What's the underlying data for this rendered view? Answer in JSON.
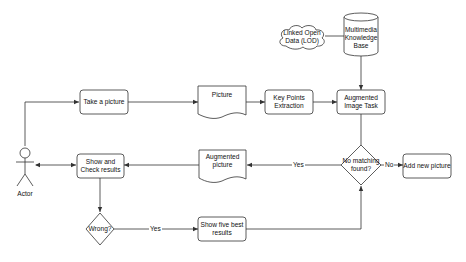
{
  "diagram": {
    "type": "flowchart",
    "nodes": {
      "take_picture": {
        "label": "Take a picture",
        "shape": "rounded-rect"
      },
      "picture": {
        "label": "Picture",
        "shape": "document"
      },
      "key_points": {
        "label": "Key Points Extraction",
        "shape": "rounded-rect"
      },
      "augmented_task": {
        "label": "Augmented Image Task",
        "shape": "rounded-rect"
      },
      "knowledge_base": {
        "label": "Multimedia Knowledge Base",
        "shape": "cylinder"
      },
      "lod": {
        "label": "Linked Open Data (LOD)",
        "shape": "cloud"
      },
      "no_matching": {
        "label": "No matching found?",
        "shape": "diamond"
      },
      "add_new": {
        "label": "Add new picture",
        "shape": "rounded-rect"
      },
      "augmented_picture": {
        "label": "Augmented picture",
        "shape": "document"
      },
      "show_check": {
        "label": "Show and Check results",
        "shape": "rounded-rect"
      },
      "wrong": {
        "label": "Wrong?",
        "shape": "diamond"
      },
      "show_five": {
        "label": "Show five best results",
        "shape": "rounded-rect"
      },
      "actor": {
        "label": "Actor",
        "shape": "stick-figure"
      }
    },
    "edges": {
      "yes_to_augmented": "Yes",
      "no_to_add_new": "No",
      "wrong_yes": "Yes"
    },
    "colors": {
      "stroke": "#333333",
      "fill": "#ffffff",
      "text": "#111111"
    }
  }
}
